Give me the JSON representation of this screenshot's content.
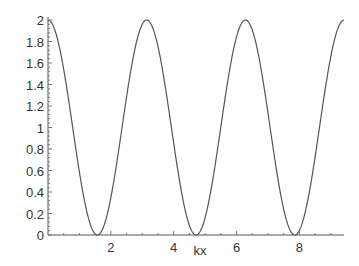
{
  "chart_data": {
    "type": "line",
    "title": "",
    "xlabel": "kx",
    "ylabel": "",
    "xlim": [
      0,
      9.42
    ],
    "ylim": [
      0,
      2
    ],
    "grid": false,
    "legend": null,
    "x_ticks": [
      "2",
      "4",
      "6",
      "8"
    ],
    "x_tick_values": [
      2,
      4,
      6,
      8
    ],
    "y_ticks": [
      "0",
      "0.2",
      "0.4",
      "0.6",
      "0.8",
      "1",
      "1.2",
      "1.4",
      "1.6",
      "1.8",
      "2"
    ],
    "y_tick_values": [
      0,
      0.2,
      0.4,
      0.6,
      0.8,
      1,
      1.2,
      1.4,
      1.6,
      1.8,
      2
    ],
    "series": [
      {
        "name": "2cos^2(kx)",
        "color": "#555555",
        "x": [
          0,
          0.785,
          1.571,
          2.356,
          3.142,
          3.927,
          4.712,
          5.498,
          6.283,
          7.069,
          7.854,
          8.639,
          9.425
        ],
        "values": [
          2,
          1,
          0,
          1,
          2,
          1,
          0,
          1,
          2,
          1,
          0,
          1,
          2
        ]
      }
    ]
  }
}
